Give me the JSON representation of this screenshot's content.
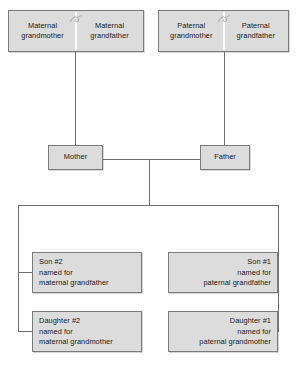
{
  "diagram": {
    "colors": {
      "box_fill": "#dcdcdc",
      "box_border": "#7a7a7a",
      "line": "#6f6f6f",
      "text": "#1a1a1a",
      "background": "#fefefe"
    }
  },
  "generation1": {
    "maternal": {
      "grandmother": "Maternal\ngrandmother",
      "grandmother_line1": "Maternal",
      "grandmother_line2": "grandmother",
      "grandfather_line1": "Maternal",
      "grandfather_line2": "grandfather",
      "union_icon": "marriage-union-icon"
    },
    "paternal": {
      "grandmother_line1": "Paternal",
      "grandmother_line2": "grandmother",
      "grandfather_line1": "Paternal",
      "grandfather_line2": "grandfather",
      "union_icon": "marriage-union-icon"
    }
  },
  "generation2": {
    "mother": "Mother",
    "father": "Father"
  },
  "generation3": {
    "son2": {
      "line1": "Son #2",
      "line2": "named for",
      "line3": "maternal grandfather"
    },
    "son1": {
      "line1": "Son #1",
      "line2": "named for",
      "line3": "paternal grandfather"
    },
    "daughter2": {
      "line1": "Daughter #2",
      "line2": "named for",
      "line3": "maternal grandmother"
    },
    "daughter1": {
      "line1": "Daughter #1",
      "line2": "named for",
      "line3": "paternal grandmother"
    }
  }
}
